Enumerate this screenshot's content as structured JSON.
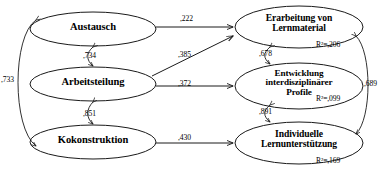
{
  "diagram": {
    "type": "structural-equation-path-model",
    "exogenous_nodes": [
      {
        "id": "austausch",
        "label": "Austausch",
        "cx": 93,
        "cy": 29,
        "rx": 63,
        "ry": 17,
        "font_size": 10.5
      },
      {
        "id": "arbeitsteilung",
        "label": "Arbeitsteilung",
        "cx": 93,
        "cy": 84,
        "rx": 63,
        "ry": 17,
        "font_size": 10.5
      },
      {
        "id": "kokonstruktion",
        "label": "Kokonstruktion",
        "cx": 93,
        "cy": 142,
        "rx": 63,
        "ry": 17,
        "font_size": 10.5
      }
    ],
    "endogenous_nodes": [
      {
        "id": "erarbeitung",
        "line1": "Erarbeitung von",
        "line2": "Lernmaterial",
        "line3": "",
        "cx": 299,
        "cy": 27,
        "rx": 64,
        "ry": 21,
        "font_size": 9.6,
        "r2": "R²=,206",
        "r2_x": 316,
        "r2_y": 42
      },
      {
        "id": "entwicklung",
        "line1": "Entwicklung",
        "line2": "interdisziplinärer",
        "line3": "Profile",
        "cx": 299,
        "cy": 86,
        "rx": 64,
        "ry": 23,
        "font_size": 9.2,
        "r2": "R²=,099",
        "r2_x": 316,
        "r2_y": 95
      },
      {
        "id": "individuelle",
        "line1": "Individuelle",
        "line2": "Lernunterstützung",
        "line3": "",
        "cx": 299,
        "cy": 143,
        "rx": 64,
        "ry": 21,
        "font_size": 9.6,
        "r2": "R²=,169",
        "r2_x": 316,
        "r2_y": 157
      }
    ],
    "path_coefficients": [
      {
        "id": "austausch-to-erarbeitung",
        "value": ",222",
        "x": 180,
        "y": 14
      },
      {
        "id": "arbeitsteilung-to-erarbeitung",
        "value": ",385",
        "x": 178,
        "y": 50
      },
      {
        "id": "arbeitsteilung-to-entwicklung",
        "value": ",372",
        "x": 178,
        "y": 79
      },
      {
        "id": "kokonstruktion-to-individuelle",
        "value": ",430",
        "x": 178,
        "y": 133
      }
    ],
    "correlations": [
      {
        "id": "austausch-arbeitsteilung",
        "value": ",734",
        "x": 83,
        "y": 50
      },
      {
        "id": "arbeitsteilung-kokonstruktion",
        "value": ",851",
        "x": 83,
        "y": 108
      },
      {
        "id": "austausch-kokonstruktion",
        "value": ",733",
        "x": 2,
        "y": 75
      }
    ],
    "residual_correlations": [
      {
        "id": "erarbeitung-entwicklung",
        "value": ",678",
        "x": 258,
        "y": 49
      },
      {
        "id": "entwicklung-individuelle",
        "value": ",891",
        "x": 258,
        "y": 106
      },
      {
        "id": "erarbeitung-individuelle",
        "value": ",689",
        "x": 363,
        "y": 79
      }
    ],
    "colors": {
      "stroke": "#1a1a1a",
      "text": "#000000",
      "background": "#ffffff"
    }
  }
}
